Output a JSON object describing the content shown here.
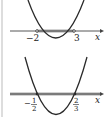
{
  "graphs": [
    {
      "id": "top",
      "roots": [
        "-2",
        "3"
      ],
      "root_label_left": "−2",
      "root_label_right": "3",
      "axis_label": "x",
      "highlight": "between roots"
    },
    {
      "id": "bottom",
      "roots": [
        "-1/2",
        "2/3"
      ],
      "root_left_num": "1",
      "root_left_den": "2",
      "root_left_sign": "−",
      "root_right_num": "2",
      "root_right_den": "3",
      "axis_label": "x",
      "highlight": "entire axis"
    }
  ],
  "colors": {
    "curve": "#2a2a2a",
    "axis": "#444444",
    "highlight": "#9a9a9a",
    "border": "#bbbbbb"
  }
}
